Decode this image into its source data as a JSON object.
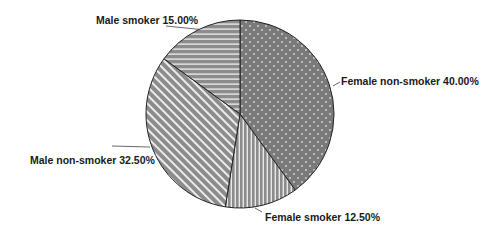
{
  "chart_data": {
    "type": "pie",
    "title": "",
    "start_angle": "12 o'clock",
    "direction": "clockwise",
    "slices": [
      {
        "label": "Female non-smoker",
        "value": 40.0,
        "display": "Female non-smoker 40.00%",
        "pattern": "dots",
        "color": "#7a7a7a"
      },
      {
        "label": "Female smoker",
        "value": 12.5,
        "display": "Female smoker 12.50%",
        "pattern": "vertical-stripes",
        "color": "#8a8a8a"
      },
      {
        "label": "Male non-smoker",
        "value": 32.5,
        "display": "Male non-smoker 32.50%",
        "pattern": "diagonal-stripes",
        "color": "#8a8a8a"
      },
      {
        "label": "Male smoker",
        "value": 15.0,
        "display": "Male smoker 15.00%",
        "pattern": "horizontal-stripes",
        "color": "#8a8a8a"
      }
    ],
    "legend": "none",
    "value_format": "percent, 2 decimals"
  }
}
